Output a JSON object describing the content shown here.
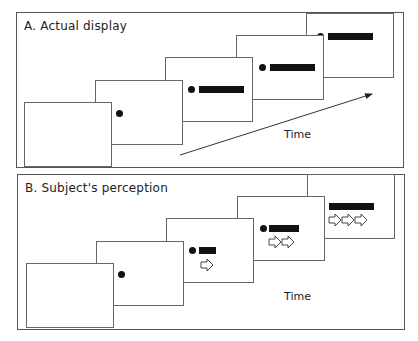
{
  "panels": [
    {
      "id": "A",
      "title": "A. Actual display",
      "time_label": "Time",
      "frames": [
        {
          "dot": false,
          "bar_width": 0,
          "arrows": 0
        },
        {
          "dot": true,
          "bar_width": 0,
          "arrows": 0
        },
        {
          "dot": true,
          "bar_width": 45,
          "arrows": 0
        },
        {
          "dot": true,
          "bar_width": 45,
          "arrows": 0
        },
        {
          "dot": true,
          "bar_width": 45,
          "arrows": 0
        }
      ]
    },
    {
      "id": "B",
      "title": "B. Subject's perception",
      "time_label": "Time",
      "frames": [
        {
          "dot": false,
          "bar_width": 0,
          "arrows": 0
        },
        {
          "dot": true,
          "bar_width": 0,
          "arrows": 0
        },
        {
          "dot": true,
          "bar_width": 17,
          "arrows": 1
        },
        {
          "dot": true,
          "bar_width": 30,
          "arrows": 2
        },
        {
          "dot": true,
          "bar_width": 45,
          "arrows": 3
        }
      ]
    }
  ],
  "colors": {
    "ink": "#111111",
    "frame_border": "#666666",
    "panel_border": "#555555"
  }
}
